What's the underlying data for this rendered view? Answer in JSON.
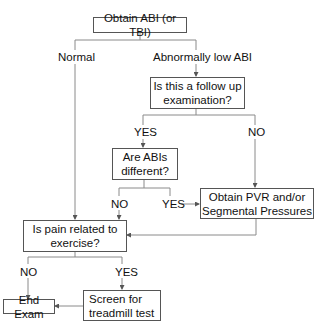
{
  "nodes": {
    "start": "Obtain ABI (or TBI)",
    "follow_up": "Is this a follow up examination?",
    "abis_different": "Are ABIs different?",
    "obtain_pvr": "Obtain PVR and/or Segmental Pressures",
    "pain_exercise": "Is pain related to exercise?",
    "end_exam": "End Exam",
    "screen_treadmill": "Screen for treadmill test"
  },
  "edge_labels": {
    "normal": "Normal",
    "abnormal": "Abnormally low ABI",
    "follow_up_yes": "YES",
    "follow_up_no": "NO",
    "abis_no": "NO",
    "abis_yes": "YES",
    "pain_no": "NO",
    "pain_yes": "YES"
  },
  "colors": {
    "line": "#777777",
    "border": "#555555",
    "text": "#111111"
  }
}
